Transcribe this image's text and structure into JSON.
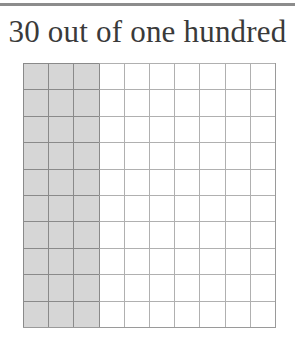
{
  "title": "30 out of one hundred",
  "grid": {
    "rows": 10,
    "cols": 10,
    "shaded_cols": 3,
    "shaded_count": 30,
    "total": 100,
    "colors": {
      "shaded": "#d6d6d6",
      "unshaded": "#ffffff",
      "line": "#8a8a8a"
    }
  }
}
